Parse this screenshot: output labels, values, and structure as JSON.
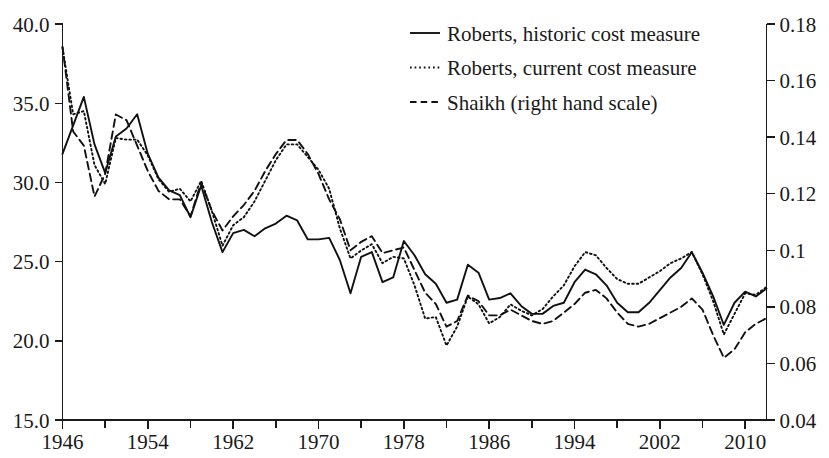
{
  "chart_data": {
    "type": "line",
    "title": "",
    "subtitle": "",
    "xlabel": "",
    "ylabel": "",
    "y2label": "",
    "grid": false,
    "legend_position": "top-right",
    "xlim": [
      1946,
      2012
    ],
    "ylim": [
      15.0,
      40.0
    ],
    "y2lim": [
      0.04,
      0.18
    ],
    "x_tick_labels": [
      "1946",
      "1954",
      "1962",
      "1970",
      "1978",
      "1986",
      "1994",
      "2002",
      "2010"
    ],
    "x_tick_values": [
      1946,
      1954,
      1962,
      1970,
      1978,
      1986,
      1994,
      2002,
      2010
    ],
    "x_minor_tick_values": [
      1950,
      1958,
      1966,
      1974,
      1982,
      1990,
      1998,
      2006
    ],
    "y_tick_labels": [
      "15.0",
      "20.0",
      "25.0",
      "30.0",
      "35.0",
      "40.0"
    ],
    "y_tick_values": [
      15.0,
      20.0,
      25.0,
      30.0,
      35.0,
      40.0
    ],
    "y2_tick_labels": [
      "0.04",
      "0.06",
      "0.08",
      "0.1",
      "0.12",
      "0.14",
      "0.16",
      "0.18"
    ],
    "y2_tick_values": [
      0.04,
      0.06,
      0.08,
      0.1,
      0.12,
      0.14,
      0.16,
      0.18
    ],
    "x": [
      1946,
      1947,
      1948,
      1949,
      1950,
      1951,
      1952,
      1953,
      1954,
      1955,
      1956,
      1957,
      1958,
      1959,
      1960,
      1961,
      1962,
      1963,
      1964,
      1965,
      1966,
      1967,
      1968,
      1969,
      1970,
      1971,
      1972,
      1973,
      1974,
      1975,
      1976,
      1977,
      1978,
      1979,
      1980,
      1981,
      1982,
      1983,
      1984,
      1985,
      1986,
      1987,
      1988,
      1989,
      1990,
      1991,
      1992,
      1993,
      1994,
      1995,
      1996,
      1997,
      1998,
      1999,
      2000,
      2001,
      2002,
      2003,
      2004,
      2005,
      2006,
      2007,
      2008,
      2009,
      2010,
      2011,
      2012
    ],
    "series": [
      {
        "name": "Roberts, historic cost measure",
        "axis": "left",
        "style": "solid",
        "values": [
          31.8,
          33.6,
          35.4,
          32.4,
          30.6,
          32.9,
          33.4,
          34.3,
          31.8,
          30.3,
          29.5,
          29.2,
          27.8,
          29.8,
          27.5,
          25.6,
          26.8,
          27.0,
          26.6,
          27.1,
          27.4,
          27.9,
          27.6,
          26.4,
          26.4,
          26.5,
          25.1,
          23.0,
          25.3,
          25.6,
          23.7,
          24.0,
          26.3,
          25.4,
          24.2,
          23.6,
          22.4,
          22.6,
          24.8,
          24.3,
          22.6,
          22.7,
          23.0,
          22.2,
          21.7,
          21.7,
          22.2,
          22.4,
          23.7,
          24.5,
          24.2,
          23.5,
          22.4,
          21.8,
          21.8,
          22.4,
          23.2,
          24.0,
          24.6,
          25.6,
          24.3,
          22.8,
          21.0,
          22.4,
          23.1,
          22.8,
          23.3
        ]
      },
      {
        "name": "Roberts, current cost measure",
        "axis": "left",
        "style": "dotted",
        "values": [
          38.5,
          34.3,
          34.5,
          31.1,
          29.9,
          32.8,
          32.7,
          32.7,
          31.7,
          30.2,
          29.4,
          29.6,
          28.8,
          30.1,
          28.2,
          26.0,
          27.3,
          27.8,
          28.8,
          30.1,
          31.4,
          32.4,
          32.4,
          31.6,
          30.8,
          29.6,
          27.1,
          25.2,
          25.7,
          26.1,
          24.9,
          25.3,
          25.2,
          23.5,
          21.4,
          21.5,
          19.7,
          20.9,
          22.8,
          22.3,
          21.1,
          21.5,
          22.3,
          21.9,
          21.6,
          22.0,
          22.8,
          23.5,
          24.7,
          25.6,
          25.4,
          24.6,
          23.9,
          23.6,
          23.6,
          24.0,
          24.4,
          24.9,
          25.2,
          25.6,
          24.2,
          22.5,
          20.4,
          21.7,
          23.0,
          22.9,
          23.4
        ]
      },
      {
        "name": "Shaikh (right hand scale)",
        "axis": "right",
        "style": "dashed",
        "values": [
          0.172,
          0.142,
          0.137,
          0.119,
          0.127,
          0.148,
          0.146,
          0.137,
          0.128,
          0.121,
          0.118,
          0.118,
          0.112,
          0.124,
          0.114,
          0.107,
          0.112,
          0.116,
          0.121,
          0.128,
          0.134,
          0.139,
          0.139,
          0.134,
          0.127,
          0.118,
          0.111,
          0.1,
          0.103,
          0.105,
          0.099,
          0.1,
          0.101,
          0.093,
          0.085,
          0.081,
          0.073,
          0.075,
          0.084,
          0.082,
          0.077,
          0.077,
          0.079,
          0.077,
          0.075,
          0.074,
          0.075,
          0.078,
          0.081,
          0.085,
          0.086,
          0.083,
          0.078,
          0.074,
          0.073,
          0.074,
          0.076,
          0.078,
          0.08,
          0.083,
          0.079,
          0.07,
          0.062,
          0.065,
          0.071,
          0.074,
          0.076
        ]
      }
    ]
  },
  "legend": {
    "entries": [
      {
        "label": "Roberts, historic cost measure",
        "style": "solid"
      },
      {
        "label": "Roberts, current cost measure",
        "style": "dotted"
      },
      {
        "label": "Shaikh (right hand scale)",
        "style": "dashed"
      }
    ]
  },
  "colors": {
    "ink": "#111111",
    "background": "#ffffff"
  }
}
